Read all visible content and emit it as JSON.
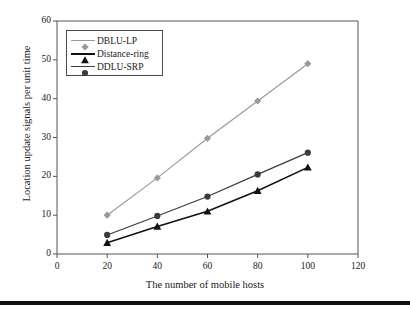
{
  "chart_data": {
    "type": "line",
    "title": "",
    "xlabel": "The number of mobile hosts",
    "ylabel": "Location update signals per unit time",
    "x": [
      20,
      40,
      60,
      80,
      100
    ],
    "xlim": [
      0,
      120
    ],
    "ylim": [
      0,
      60
    ],
    "xticks": [
      "0",
      "20",
      "40",
      "60",
      "80",
      "100",
      "120"
    ],
    "yticks": [
      "0",
      "10",
      "20",
      "30",
      "40",
      "50",
      "60"
    ],
    "grid": false,
    "legend_position": "top-left-inside",
    "series": [
      {
        "name": "DBLU-LP",
        "values": [
          10,
          19.6,
          29.8,
          39.4,
          49
        ],
        "color": "#9a9a9a",
        "marker": "diamond"
      },
      {
        "name": "Distance-ring",
        "values": [
          2.9,
          7.1,
          11,
          16.3,
          22.3
        ],
        "color": "#111111",
        "marker": "triangle"
      },
      {
        "name": "DDLU-SRP",
        "values": [
          4.9,
          9.8,
          14.8,
          20.5,
          26.1
        ],
        "color": "#3b3b3b",
        "marker": "circle"
      }
    ]
  },
  "figure": {
    "axis_color": "#555555",
    "background": "#ffffff",
    "rule_color": "#111111"
  }
}
